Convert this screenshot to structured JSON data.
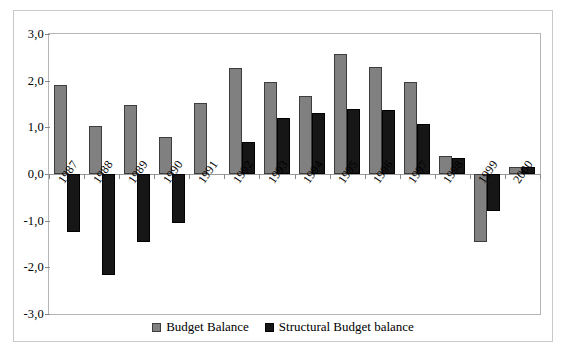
{
  "chart_data": {
    "type": "bar",
    "title": "",
    "xlabel": "",
    "ylabel": "",
    "ylim": [
      -3.0,
      3.0
    ],
    "grid": false,
    "legend_position": "bottom-center",
    "decimal_separator": ",",
    "categories": [
      "1987",
      "1988",
      "1989",
      "1990",
      "1991",
      "1992",
      "1993",
      "1994",
      "1995",
      "1996",
      "1997",
      "1998",
      "1999",
      "2000"
    ],
    "ytick_labels": [
      "3,0",
      "2,0",
      "1,0",
      "0,0",
      "-1,0",
      "-2,0",
      "-3,0"
    ],
    "ytick_values": [
      3.0,
      2.0,
      1.0,
      0.0,
      -1.0,
      -2.0,
      -3.0
    ],
    "series": [
      {
        "name": "Budget Balance",
        "color": "#808080",
        "values": [
          1.9,
          1.02,
          1.48,
          0.8,
          1.53,
          2.27,
          1.97,
          1.68,
          2.58,
          2.3,
          1.97,
          0.38,
          -1.45,
          0.14
        ]
      },
      {
        "name": "Structural Budget balance",
        "color": "#161616",
        "values": [
          -1.25,
          -2.17,
          -1.45,
          -1.05,
          0.0,
          0.69,
          1.21,
          1.3,
          1.4,
          1.38,
          1.08,
          0.34,
          -0.8,
          0.15
        ]
      }
    ]
  },
  "legend": {
    "entries": [
      {
        "label": "Budget Balance"
      },
      {
        "label": "Structural Budget balance"
      }
    ]
  },
  "caption": {
    "text": ""
  }
}
